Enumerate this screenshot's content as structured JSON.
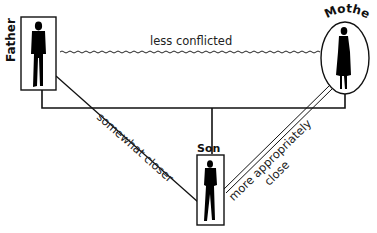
{
  "diagram": {
    "type": "family-relationship-triangle",
    "nodes": {
      "father": {
        "label": "Father",
        "shape": "rectangle"
      },
      "mother": {
        "label": "Mother",
        "shape": "ellipse"
      },
      "son": {
        "label": "Son",
        "shape": "rectangle"
      }
    },
    "edges": {
      "father_mother": {
        "label": "less conflicted",
        "style": "wavy"
      },
      "father_son": {
        "label": "somewhat closer",
        "style": "single-line"
      },
      "mother_son": {
        "label_line1": "more appropriately",
        "label_line2": "close",
        "style": "double-line"
      }
    },
    "colors": {
      "ink": "#111111",
      "background": "#ffffff"
    }
  }
}
